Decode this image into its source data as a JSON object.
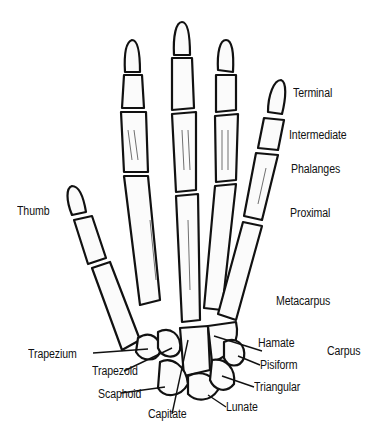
{
  "diagram": {
    "labels": {
      "terminal": "Terminal",
      "intermediate": "Intermediate",
      "phalanges": "Phalanges",
      "proximal": "Proximal",
      "thumb": "Thumb",
      "metacarpus": "Metacarpus",
      "hamate": "Hamate",
      "carpus": "Carpus",
      "pisiform": "Pisiform",
      "trapezium": "Trapezium",
      "trapezoid": "Trapezoid",
      "triangular": "Triangular",
      "scaphoid": "Scaphoid",
      "capitate": "Capitate",
      "lunate": "Lunate"
    }
  }
}
